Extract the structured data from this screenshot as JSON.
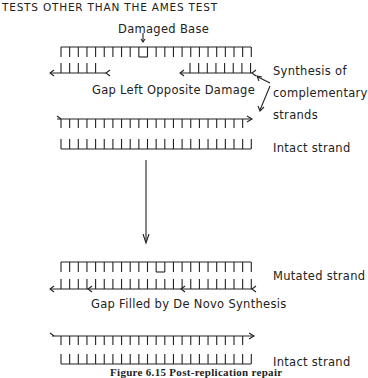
{
  "header": {
    "title": "TESTS OTHER THAN THE AMES TEST"
  },
  "diagram": {
    "top_stage": {
      "damaged_base_label": "Damaged Base",
      "gap_label": "Gap Left Opposite Damage",
      "synthesis_label_line1": "Synthesis of",
      "synthesis_label_line2": "complementary",
      "synthesis_label_line3": "strands",
      "intact_strand_label": "Intact strand"
    },
    "bottom_stage": {
      "mutated_strand_label": "Mutated strand",
      "gap_filled_label": "Gap Filled by De Novo Synthesis",
      "intact_strand_label": "Intact strand"
    },
    "caption": "Figure 6.15  Post-replication repair"
  },
  "colors": {
    "ink": "#222222",
    "background": "#ffffff"
  }
}
